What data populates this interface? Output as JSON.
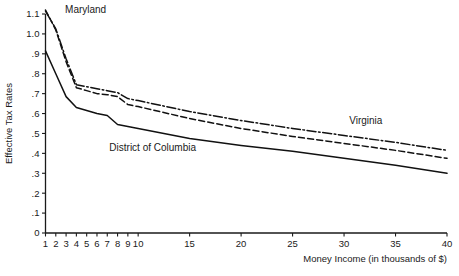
{
  "chart_data": {
    "type": "line",
    "title": "",
    "xlabel": "Money Income (in thousands of $)",
    "ylabel": "Effective Tax Rates",
    "xlim": [
      1,
      40
    ],
    "ylim": [
      0,
      1.1
    ],
    "grid": false,
    "legend_position": "inline-annotations",
    "xticks": [
      1,
      2,
      3,
      4,
      5,
      6,
      7,
      8,
      9,
      10,
      15,
      20,
      25,
      30,
      35,
      40
    ],
    "xtick_labels": [
      "1",
      "2",
      "3",
      "4",
      "5",
      "6",
      "7",
      "8",
      "9",
      "10",
      "15",
      "20",
      "25",
      "30",
      "35",
      "40"
    ],
    "yticks": [
      0,
      0.1,
      0.2,
      0.3,
      0.4,
      0.5,
      0.6,
      0.7,
      0.8,
      0.9,
      1.0,
      1.1
    ],
    "ytick_labels": [
      "0",
      ".1",
      ".2",
      ".3",
      ".4",
      ".5",
      ".6",
      ".7",
      ".8",
      ".9",
      "1.0",
      "1.1"
    ],
    "x": [
      1,
      2,
      3,
      4,
      5,
      6,
      7,
      8,
      9,
      10,
      15,
      20,
      25,
      30,
      35,
      40
    ],
    "series": [
      {
        "name": "Maryland",
        "style": "dashed",
        "color": "#111111",
        "values": [
          1.12,
          1.02,
          0.86,
          0.73,
          0.715,
          0.7,
          0.695,
          0.685,
          0.645,
          0.635,
          0.575,
          0.525,
          0.485,
          0.45,
          0.415,
          0.375
        ],
        "label_x": 2.9,
        "label_y": 1.105
      },
      {
        "name": "Virginia",
        "style": "dashdot",
        "color": "#111111",
        "values": [
          1.115,
          1.025,
          0.875,
          0.745,
          0.735,
          0.725,
          0.715,
          0.705,
          0.675,
          0.665,
          0.61,
          0.565,
          0.525,
          0.49,
          0.455,
          0.415
        ],
        "label_x": 30.5,
        "label_y": 0.545
      },
      {
        "name": "District of Columbia",
        "style": "solid",
        "color": "#111111",
        "values": [
          0.915,
          0.8,
          0.685,
          0.63,
          0.615,
          0.6,
          0.59,
          0.545,
          0.535,
          0.525,
          0.475,
          0.44,
          0.41,
          0.375,
          0.34,
          0.3
        ],
        "label_x": 7.2,
        "label_y": 0.41
      }
    ]
  }
}
